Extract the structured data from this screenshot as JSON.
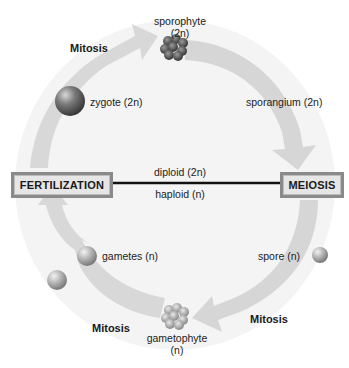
{
  "diagram": {
    "stages": {
      "sporophyte": {
        "line1": "sporophyte",
        "line2": "(2n)"
      },
      "zygote": "zygote (2n)",
      "sporangium": "sporangium (2n)",
      "spore": "spore (n)",
      "gametophyte": {
        "line1": "gametophyte",
        "line2": "(n)"
      },
      "gametes": "gametes (n)"
    },
    "processes": {
      "mitosis_top": "Mitosis",
      "mitosis_bottom_left": "Mitosis",
      "mitosis_bottom_right": "Mitosis",
      "fertilization": "FERTILIZATION",
      "meiosis": "MEIOSIS"
    },
    "divider": {
      "above": "diploid (2n)",
      "below": "haploid (n)"
    },
    "colors": {
      "arrow": "#d6d6d6",
      "box_border": "#8a8a8a",
      "box_fill": "#e6e6e6",
      "divider_line": "#111111"
    }
  }
}
